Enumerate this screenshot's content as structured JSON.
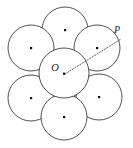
{
  "figure": {
    "kind": "geometry-diagram",
    "canvas": {
      "width": 133,
      "height": 148
    },
    "colors": {
      "background": "#ffffff",
      "circle_stroke": "#3c3c3c",
      "center_dot": "#111111",
      "ray_stroke": "#555555",
      "label": "#1a1a1a"
    },
    "circle_radius": 25,
    "circles": [
      {
        "name": "center-circle",
        "cx": 64,
        "cy": 73,
        "r": 25,
        "has_center_dot": true
      },
      {
        "name": "top-circle",
        "cx": 65,
        "cy": 30,
        "r": 23,
        "has_center_dot": true
      },
      {
        "name": "upper-left-circle",
        "cx": 31,
        "cy": 48,
        "r": 23,
        "has_center_dot": true
      },
      {
        "name": "upper-right-circle",
        "cx": 97,
        "cy": 48,
        "r": 23,
        "has_center_dot": true
      },
      {
        "name": "lower-left-circle",
        "cx": 31,
        "cy": 98,
        "r": 23,
        "has_center_dot": true
      },
      {
        "name": "lower-right-circle",
        "cx": 99,
        "cy": 97,
        "r": 23,
        "has_center_dot": true
      },
      {
        "name": "bottom-circle",
        "cx": 64,
        "cy": 117,
        "r": 23,
        "has_center_dot": true
      }
    ],
    "ray": {
      "name": "ray-O-to-P",
      "from": {
        "x": 64,
        "y": 74
      },
      "through": {
        "x": 97,
        "y": 48
      },
      "to": {
        "x": 121,
        "y": 39
      },
      "style": "dotted"
    },
    "labels": [
      {
        "id": "O",
        "text": "O",
        "x": 59,
        "y": 70,
        "anchor_point": {
          "x": 64,
          "y": 74
        }
      },
      {
        "id": "P",
        "text": "P",
        "x": 115,
        "y": 35,
        "anchor_point": {
          "x": 121,
          "y": 39
        }
      }
    ]
  }
}
